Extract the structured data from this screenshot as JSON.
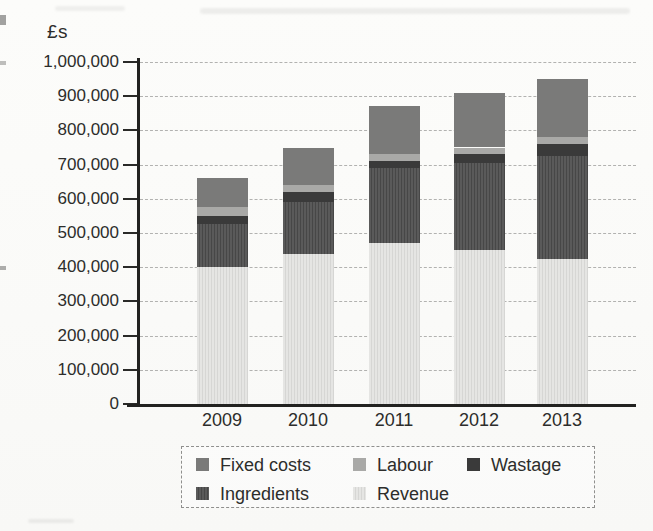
{
  "chart_data": {
    "type": "bar",
    "stacked": true,
    "title": "",
    "ylabel": "£s",
    "xlabel": "",
    "categories": [
      "2009",
      "2010",
      "2011",
      "2012",
      "2013"
    ],
    "series": [
      {
        "name": "Revenue",
        "values": [
          400000,
          440000,
          470000,
          450000,
          425000
        ],
        "color": "#e5e5e3",
        "stripe": "#d6d6d4",
        "striped": true
      },
      {
        "name": "Ingredients",
        "values": [
          125000,
          150000,
          220000,
          255000,
          300000
        ],
        "color": "#5a5a5a",
        "stripe": "#474747",
        "striped": true
      },
      {
        "name": "Wastage",
        "values": [
          25000,
          30000,
          20000,
          25000,
          35000
        ],
        "color": "#3a3a3a",
        "stripe": "#3a3a3a",
        "striped": false
      },
      {
        "name": "Labour",
        "values": [
          25000,
          20000,
          20000,
          20000,
          20000
        ],
        "color": "#a9a9a7",
        "stripe": "#a9a9a7",
        "striped": false
      },
      {
        "name": "Fixed costs",
        "values": [
          85000,
          110000,
          140000,
          160000,
          170000
        ],
        "color": "#7a7a79",
        "stripe": "#7a7a79",
        "striped": false
      }
    ],
    "y_axis": {
      "min": 0,
      "max": 1000000,
      "tick_step": 100000,
      "tick_labels": [
        "0",
        "100,000",
        "200,000",
        "300,000",
        "400,000",
        "500,000",
        "600,000",
        "700,000",
        "800,000",
        "900,000",
        "1,000,000"
      ]
    },
    "grid": {
      "horizontal": true,
      "style": "dashed"
    },
    "legend": {
      "position": "bottom",
      "rows": [
        [
          "Fixed costs",
          "Labour",
          "Wastage"
        ],
        [
          "Ingredients",
          "Revenue"
        ]
      ]
    },
    "style": {
      "axis_color": "#222220",
      "grid_color": "#b2b2b0",
      "text_color": "#2d2d2b",
      "page_background": "#fbfbf9",
      "legend_border": "#8f8f8d"
    }
  }
}
